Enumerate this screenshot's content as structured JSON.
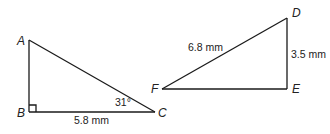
{
  "triangle_abc": {
    "vertices": {
      "A": {
        "label": "A",
        "x": 29,
        "y": 40
      },
      "B": {
        "label": "B",
        "x": 29,
        "y": 112
      },
      "C": {
        "label": "C",
        "x": 155,
        "y": 112
      }
    },
    "right_angle_at": "B",
    "angle_label": "31°",
    "side_bc_label": "5.8 mm"
  },
  "triangle_def": {
    "vertices": {
      "D": {
        "label": "D",
        "x": 287,
        "y": 18
      },
      "E": {
        "label": "E",
        "x": 287,
        "y": 89
      },
      "F": {
        "label": "F",
        "x": 162,
        "y": 89
      }
    },
    "side_df_label": "6.8 mm",
    "side_de_label": "3.5 mm"
  },
  "colors": {
    "stroke": "#1a1a1a",
    "text": "#222222",
    "background": "#ffffff"
  }
}
